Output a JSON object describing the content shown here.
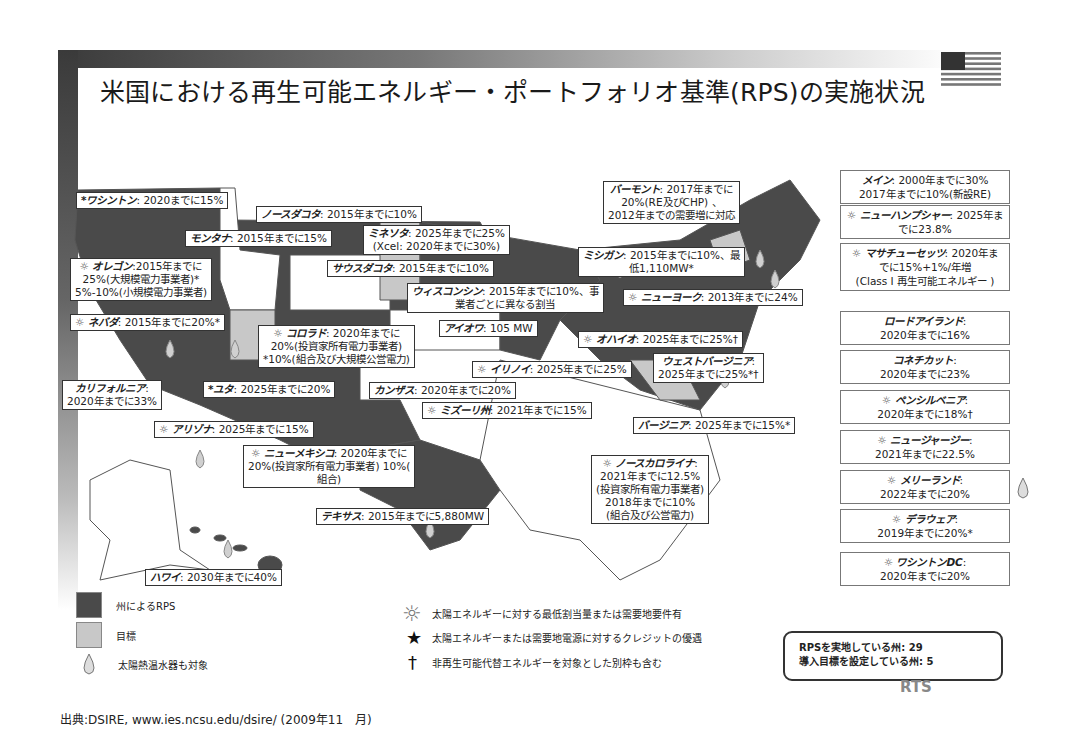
{
  "title": "米国における再生可能エネルギー・ポートフォリオ基準(RPS)の実施状況",
  "flag_icon": "us-flag-icon",
  "map_labels": [
    {
      "id": "washington",
      "name": "*ワシントン",
      "text": ": 2020までに15%"
    },
    {
      "id": "north-dakota",
      "name": "ノースダコタ",
      "text": ": 2015年までに10%"
    },
    {
      "id": "montana",
      "name": "モンタナ",
      "text": ": 2015年までに15%"
    },
    {
      "id": "minnesota",
      "name": "ミネソタ",
      "text": ": 2025年までに25%",
      "line2": "(Xcel: 2020年までに30%)"
    },
    {
      "id": "oregon",
      "name": "オレゴン",
      "sun": true,
      "text": ":2015年までに",
      "line2": "25%(大規模電力事業者)*",
      "line3": "5%-10%(小規模電力事業者)"
    },
    {
      "id": "south-dakota",
      "name": "サウスダコタ",
      "text": ": 2015年までに10%"
    },
    {
      "id": "wisconsin",
      "name": "ウィスコンシン",
      "text": ": 2015年までに10%、事",
      "line2": "業者ごとに異なる割当"
    },
    {
      "id": "nevada",
      "name": "ネバダ",
      "sun": true,
      "text": ": 2015年までに20%*"
    },
    {
      "id": "colorado",
      "name": "コロラド",
      "sun": true,
      "text": ": 2020年までに",
      "line2": "20%(投資家所有電力事業者)",
      "line3": "*10%(組合及び大規模公営電力)"
    },
    {
      "id": "iowa",
      "name": "アイオワ",
      "text": ": 105 MW"
    },
    {
      "id": "california",
      "name": "カリフォルニア",
      "text": ":",
      "line2": "2020年までに33%"
    },
    {
      "id": "utah",
      "name": "*ユタ",
      "text": ": 2025年までに20%"
    },
    {
      "id": "kansas",
      "name": "カンザス",
      "text": ": 2020年までに20%"
    },
    {
      "id": "illinois",
      "name": "イリノイ",
      "sun": true,
      "text": ": 2025年までに25%"
    },
    {
      "id": "missouri",
      "name": "ミズーリ州",
      "sun": true,
      "text": ": 2021年までに15%"
    },
    {
      "id": "arizona",
      "name": "アリゾナ",
      "sun": true,
      "text": ": 2025年までに15%"
    },
    {
      "id": "new-mexico",
      "name": "ニューメキシコ",
      "sun": true,
      "text": ": 2020年までに",
      "line2": "20%(投資家所有電力事業者) 10%(",
      "line3": "組合)"
    },
    {
      "id": "texas",
      "name": "テキサス",
      "text": ": 2015年までに5,880MW"
    },
    {
      "id": "hawaii",
      "name": "ハワイ",
      "text": ": 2030年までに40%"
    },
    {
      "id": "vermont",
      "name": "バーモント",
      "text": ": 2017年までに",
      "line2": "20%(RE及びCHP) 、",
      "line3": "2012年までの需要増に対応"
    },
    {
      "id": "michigan",
      "name": "ミシガン",
      "text": ": 2015年までに10%、最",
      "line2": "低1,110MW*"
    },
    {
      "id": "new-york",
      "name": "ニューヨーク",
      "sun": true,
      "text": ": 2013年までに24%"
    },
    {
      "id": "ohio",
      "name": "オハイオ",
      "sun": true,
      "text": ": 2025年までに25%†"
    },
    {
      "id": "west-virginia",
      "name": "ウェストバージニア",
      "text": ":",
      "line2": "2025年までに25%*†"
    },
    {
      "id": "virginia",
      "name": "バージニア",
      "text": ": 2025年までに15%*"
    },
    {
      "id": "north-carolina",
      "name": "ノースカロライナ",
      "sun": true,
      "text": ":",
      "line2": "2021年までに12.5%",
      "line3": "(投資家所有電力事業者)",
      "line4": "2018年までに10%",
      "line5": "(組合及び公営電力)"
    }
  ],
  "right_boxes": [
    {
      "id": "maine",
      "name": "メイン",
      "text": ": 2000年までに30%",
      "line2": "2017年までに10%(新設RE)"
    },
    {
      "id": "new-hampshire",
      "name": "ニューハンプシャー",
      "sun": true,
      "text": ": 2025年ま",
      "line2": "でに23.8%"
    },
    {
      "id": "massachusetts",
      "name": "マサチューセッツ",
      "sun": true,
      "text": ": 2020年ま",
      "line2": "でに15%+1%/年増",
      "line3": "(Class I 再生可能エネルギー )"
    },
    {
      "id": "rhode-island",
      "name": "ロードアイランド",
      "text": ":",
      "line2": "2020年までに16%"
    },
    {
      "id": "connecticut",
      "name": "コネチカット",
      "text": ":",
      "line2": "2020年までに23%"
    },
    {
      "id": "pennsylvania",
      "name": "ペンシルベニア",
      "sun": true,
      "text": ":",
      "line2": "2020年までに18%†"
    },
    {
      "id": "new-jersey",
      "name": "ニュージャージー",
      "sun": true,
      "text": ":",
      "line2": "2021年までに22.5%"
    },
    {
      "id": "maryland",
      "name": "メリーランド",
      "sun": true,
      "text": ":",
      "line2": "2022年までに20%",
      "drop": true
    },
    {
      "id": "delaware",
      "name": "デラウェア",
      "sun": true,
      "text": ":",
      "line2": "2019年までに20%*"
    },
    {
      "id": "washington-dc",
      "name": "ワシントンDC",
      "sun": true,
      "text": ":",
      "line2": "2020年までに20%"
    }
  ],
  "legend": {
    "state_rps": "州によるRPS",
    "goal": "目標",
    "solar_water_heater": "太陽熱温水器も対象",
    "sun_desc": "太陽エネルギーに対する最低割当量または需要地要件有",
    "star_desc": "太陽エネルギーまたは需要地電源に対するクレジットの優遇",
    "dagger_desc": "非再生可能代替エネルギーを対象とした別枠も含む"
  },
  "summary": {
    "rps_states_label": "RPSを実地している州:",
    "rps_states_count": "29",
    "goal_states_label": "導入目標を設定している州:",
    "goal_states_count": "5"
  },
  "logo": "RTS",
  "source": "出典:DSIRE, www.ies.ncsu.edu/dsire/ (2009年11　月)",
  "colors": {
    "rps": "#4a4a4a",
    "goal": "#c8c8c8",
    "none": "#ffffff",
    "outline": "#555555"
  }
}
